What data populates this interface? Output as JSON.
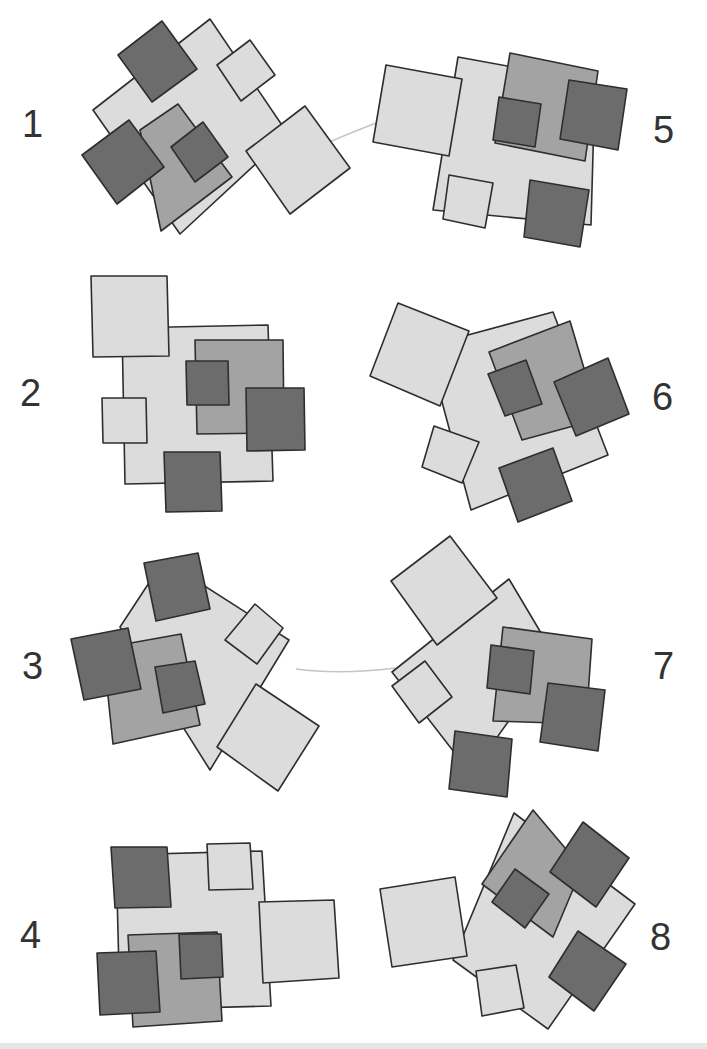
{
  "colors": {
    "light": "#dcdcdc",
    "mid": "#a3a3a3",
    "dark": "#6c6c6c",
    "stroke": "#2e2e2e",
    "label": "#333333",
    "connector": "#c4c4c4"
  },
  "figures": [
    {
      "id": 1,
      "label": "1",
      "label_pos": [
        22,
        105
      ],
      "shapes": [
        {
          "tone": "light",
          "points": "93,110 210,19 288,134 180,234"
        },
        {
          "tone": "dark",
          "points": "118,55 162,21 197,69 152,102"
        },
        {
          "tone": "light",
          "points": "217,65 250,40 275,75 241,101"
        },
        {
          "tone": "mid",
          "points": "140,130 178,104 232,177 161,231"
        },
        {
          "tone": "dark",
          "points": "82,155 129,120 164,167 117,204"
        },
        {
          "tone": "dark",
          "points": "171,147 203,122 228,157 195,182"
        },
        {
          "tone": "light",
          "points": "246,151 305,106 350,168 290,214"
        }
      ],
      "connector": "M305,153 Q350,132 398,115"
    },
    {
      "id": 5,
      "label": "5",
      "label_pos": [
        653,
        111
      ],
      "shapes": [
        {
          "tone": "light",
          "points": "458,57 595,82 591,225 433,210"
        },
        {
          "tone": "light",
          "points": "386,65 462,79 449,156 373,142"
        },
        {
          "tone": "mid",
          "points": "510,53 598,71 585,161 495,143"
        },
        {
          "tone": "dark",
          "points": "499,97 541,104 535,147 493,140"
        },
        {
          "tone": "dark",
          "points": "569,80 627,89 618,150 560,139"
        },
        {
          "tone": "light",
          "points": "449,175 493,183 485,228 443,219"
        },
        {
          "tone": "dark",
          "points": "530,180 589,190 580,247 524,237"
        }
      ]
    },
    {
      "id": 2,
      "label": "2",
      "label_pos": [
        20,
        374
      ],
      "shapes": [
        {
          "tone": "light",
          "points": "122,328 268,325 273,481 125,484"
        },
        {
          "tone": "light",
          "points": "91,276 167,276 169,356 93,357"
        },
        {
          "tone": "mid",
          "points": "195,340 283,340 284,433 197,434"
        },
        {
          "tone": "dark",
          "points": "186,361 228,361 229,405 187,405"
        },
        {
          "tone": "dark",
          "points": "246,388 304,388 305,450 247,451"
        },
        {
          "tone": "light",
          "points": "102,398 146,398 147,443 103,443"
        },
        {
          "tone": "dark",
          "points": "164,452 220,452 222,511 166,512"
        }
      ]
    },
    {
      "id": 6,
      "label": "6",
      "label_pos": [
        652,
        378
      ],
      "shapes": [
        {
          "tone": "light",
          "points": "427,346 553,312 608,455 471,510"
        },
        {
          "tone": "light",
          "points": "398,303 469,331 440,406 370,376"
        },
        {
          "tone": "mid",
          "points": "489,352 570,321 599,419 522,440"
        },
        {
          "tone": "dark",
          "points": "488,374 526,360 542,404 505,416"
        },
        {
          "tone": "dark",
          "points": "554,382 608,358 629,414 576,436"
        },
        {
          "tone": "light",
          "points": "434,426 479,442 462,483 422,467"
        },
        {
          "tone": "dark",
          "points": "499,468 553,448 572,501 518,522"
        }
      ]
    },
    {
      "id": 3,
      "label": "3",
      "label_pos": [
        22,
        647
      ],
      "shapes": [
        {
          "tone": "light",
          "points": "120,627 164,560 289,640 210,770"
        },
        {
          "tone": "dark",
          "points": "144,563 198,553 210,609 156,621"
        },
        {
          "tone": "light",
          "points": "225,640 255,604 283,628 257,664"
        },
        {
          "tone": "mid",
          "points": "103,648 181,634 200,725 113,744"
        },
        {
          "tone": "dark",
          "points": "71,639 128,628 141,689 84,700"
        },
        {
          "tone": "dark",
          "points": "155,667 195,661 205,704 163,713"
        },
        {
          "tone": "light",
          "points": "256,684 319,726 278,791 217,747"
        }
      ],
      "connector": "M296,669 Q340,675 395,668"
    },
    {
      "id": 7,
      "label": "7",
      "label_pos": [
        653,
        647
      ],
      "shapes": [
        {
          "tone": "light",
          "points": "392,672 509,579 547,643 515,712 471,774"
        },
        {
          "tone": "light",
          "points": "391,581 450,536 497,598 437,645"
        },
        {
          "tone": "mid",
          "points": "503,627 592,639 586,724 493,721"
        },
        {
          "tone": "dark",
          "points": "491,645 534,651 530,694 487,688"
        },
        {
          "tone": "dark",
          "points": "548,683 605,690 598,751 540,742"
        },
        {
          "tone": "light",
          "points": "392,686 425,661 452,697 419,723"
        },
        {
          "tone": "dark",
          "points": "455,731 512,739 507,797 449,789"
        }
      ]
    },
    {
      "id": 4,
      "label": "4",
      "label_pos": [
        20,
        916
      ],
      "shapes": [
        {
          "tone": "light",
          "points": "116,855 262,851 271,1006 120,1010"
        },
        {
          "tone": "dark",
          "points": "111,847 167,847 171,907 115,908"
        },
        {
          "tone": "light",
          "points": "207,844 250,843 253,889 209,890"
        },
        {
          "tone": "light",
          "points": "259,902 334,900 339,978 263,983"
        },
        {
          "tone": "mid",
          "points": "128,935 217,932 222,1021 133,1027"
        },
        {
          "tone": "dark",
          "points": "179,934 221,934 223,977 181,979"
        },
        {
          "tone": "dark",
          "points": "97,953 156,951 160,1012 100,1015"
        }
      ]
    },
    {
      "id": 8,
      "label": "8",
      "label_pos": [
        650,
        918
      ],
      "shapes": [
        {
          "tone": "light",
          "points": "514,813 635,904 548,1029 453,960"
        },
        {
          "tone": "mid",
          "points": "533,810 582,868 553,937 482,884"
        },
        {
          "tone": "dark",
          "points": "583,822 629,858 596,907 550,872"
        },
        {
          "tone": "dark",
          "points": "515,869 549,894 525,928 492,902"
        },
        {
          "tone": "light",
          "points": "380,889 455,877 467,956 392,967"
        },
        {
          "tone": "light",
          "points": "476,971 516,965 524,1008 482,1016"
        },
        {
          "tone": "dark",
          "points": "578,931 626,964 594,1011 549,977"
        }
      ]
    }
  ]
}
